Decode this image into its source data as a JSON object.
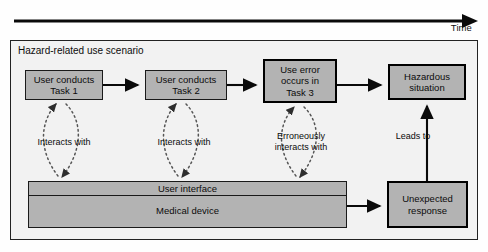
{
  "diagram": {
    "time_axis": {
      "label": "Time",
      "arrow_direction": "right"
    },
    "frame": {
      "title": "Hazard-related use scenario",
      "border_color": "#222222",
      "fill_color": "#f2f2f2"
    },
    "node_fill_color": "#b3b3b3",
    "nodes": [
      {
        "id": "task1",
        "label": "User conducts\nTask 1",
        "emphasis": "normal"
      },
      {
        "id": "task2",
        "label": "User conducts\nTask 2",
        "emphasis": "normal"
      },
      {
        "id": "error",
        "label": "Use error\noccurs in\nTask 3",
        "emphasis": "strong"
      },
      {
        "id": "hazard",
        "label": "Hazardous\nsituation",
        "emphasis": "strong"
      },
      {
        "id": "unexpected",
        "label": "Unexpected\nresponse",
        "emphasis": "strong"
      }
    ],
    "device_stack": {
      "interface_label": "User interface",
      "device_label": "Medical device"
    },
    "edge_labels": {
      "interacts_1": "Interacts with",
      "interacts_2": "Interacts with",
      "interacts_3": "Erroneously\ninteracts with",
      "leads_to": "Leads to"
    }
  }
}
